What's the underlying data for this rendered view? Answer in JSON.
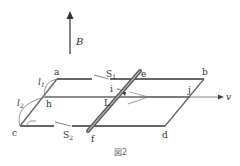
{
  "figure": {
    "caption": "図2",
    "field_label": "B",
    "velocity_label": "v",
    "current_label": "i",
    "rod_label": "L",
    "points": {
      "a": "a",
      "b": "b",
      "c": "c",
      "d": "d",
      "e": "e",
      "f": "f",
      "h": "h",
      "j": "j"
    },
    "switches": {
      "s1": "S",
      "s1_sub": "1",
      "s2": "S",
      "s2_sub": "2"
    },
    "lengths": {
      "l1": "l",
      "l1_sub": "1",
      "l2": "l",
      "l2_sub": "2"
    }
  }
}
